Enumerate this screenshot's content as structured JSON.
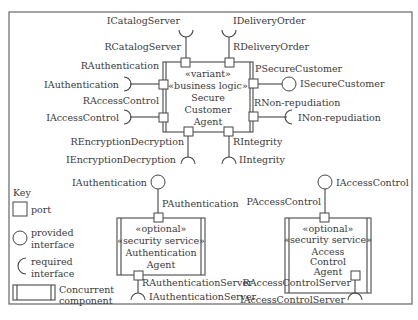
{
  "diagram": {
    "type": "UML component diagram",
    "secure_customer_agent": {
      "stereotypes": [
        "«variant»",
        "«business logic»"
      ],
      "name_lines": [
        "Secure",
        "Customer",
        "Agent"
      ],
      "ports": {
        "top_left": {
          "port": "RCatalogServer",
          "interface": "ICatalogServer",
          "kind": "required"
        },
        "top_right": {
          "port": "RDeliveryOrder",
          "interface": "IDeliveryOrder",
          "kind": "required"
        },
        "left_top": {
          "port": "RAuthentication",
          "interface": "IAuthentication",
          "kind": "required"
        },
        "left_bottom": {
          "port": "RAccessControl",
          "interface": "IAccessControl",
          "kind": "required"
        },
        "right_top": {
          "port": "PSecureCustomer",
          "interface": "ISecureCustomer",
          "kind": "provided"
        },
        "right_bottom": {
          "port": "RNon-repudiation",
          "interface": "INon-repudiation",
          "kind": "required"
        },
        "bottom_left": {
          "port": "REncryptionDecryption",
          "interface": "IEncryptionDecryption",
          "kind": "required"
        },
        "bottom_right": {
          "port": "RIntegrity",
          "interface": "IIntegrity",
          "kind": "required"
        }
      }
    },
    "authentication_agent": {
      "stereotypes": [
        "«optional»",
        "«security service»"
      ],
      "name_lines": [
        "Authentication",
        "Agent"
      ],
      "ports": {
        "top": {
          "port": "PAuthentication",
          "interface": "IAuthentication",
          "kind": "provided"
        },
        "bottom": {
          "port": "RAuthenticationServer",
          "interface": "IAuthenticationServer",
          "kind": "required"
        }
      }
    },
    "access_control_agent": {
      "stereotypes": [
        "«optional»",
        "«security service»"
      ],
      "name_lines": [
        "Access",
        "Control",
        "Agent"
      ],
      "ports": {
        "top": {
          "port": "PAccessControl",
          "interface": "IAccessControl",
          "kind": "provided"
        },
        "bottom": {
          "port": "RAccessControlServer",
          "interface": "IAccessControlServer",
          "kind": "required"
        }
      }
    },
    "key": {
      "title": "Key",
      "items": [
        {
          "symbol": "square",
          "label_lines": [
            "port"
          ]
        },
        {
          "symbol": "circle",
          "label_lines": [
            "provided",
            "interface"
          ]
        },
        {
          "symbol": "half-circle",
          "label_lines": [
            "required",
            "interface"
          ]
        },
        {
          "symbol": "double-bar-box",
          "label_lines": [
            "Concurrent",
            "component"
          ]
        }
      ]
    }
  }
}
